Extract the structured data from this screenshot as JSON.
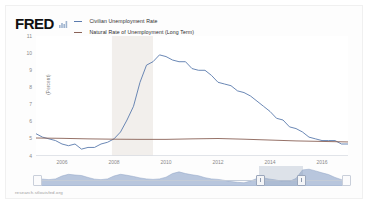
{
  "brand": {
    "logo_text": "FRED",
    "logo_mark": "mini-bar-chart-icon"
  },
  "legend": {
    "items": [
      {
        "label": "Civilian Unemployment Rate",
        "color": "#5a7aad",
        "icon": "line-dash-icon"
      },
      {
        "label": "Natural Rate of Unemployment (Long Term)",
        "color": "#8a6257",
        "icon": "line-dash-icon"
      }
    ]
  },
  "footer": {
    "source": "research.stlouisfed.org"
  },
  "navigator": {
    "selection_label": "",
    "left_handle": "range-handle-left",
    "right_handle": "range-handle-right"
  },
  "chart_data": {
    "type": "line",
    "title": "",
    "xlabel": "",
    "ylabel": "(Percent)",
    "ylim": [
      4,
      11
    ],
    "xlim": [
      2005.0,
      2017.0
    ],
    "grid": false,
    "legend_position": "top-left",
    "yticks": [
      11,
      10,
      9,
      8,
      7,
      6,
      5,
      4
    ],
    "xticks": [
      2006,
      2008,
      2010,
      2012,
      2014,
      2016
    ],
    "shaded_regions": [
      {
        "name": "recession",
        "x0": 2007.92,
        "x1": 2009.5,
        "color": "#f2efec"
      }
    ],
    "series": [
      {
        "name": "Civilian Unemployment Rate",
        "color": "#5a7aad",
        "x": [
          2005.0,
          2005.25,
          2005.5,
          2005.75,
          2006.0,
          2006.25,
          2006.5,
          2006.75,
          2007.0,
          2007.25,
          2007.5,
          2007.75,
          2008.0,
          2008.25,
          2008.5,
          2008.75,
          2009.0,
          2009.25,
          2009.5,
          2009.75,
          2010.0,
          2010.25,
          2010.5,
          2010.75,
          2011.0,
          2011.25,
          2011.5,
          2011.75,
          2012.0,
          2012.25,
          2012.5,
          2012.75,
          2013.0,
          2013.25,
          2013.5,
          2013.75,
          2014.0,
          2014.25,
          2014.5,
          2014.75,
          2015.0,
          2015.25,
          2015.5,
          2015.75,
          2016.0,
          2016.25,
          2016.5,
          2016.75,
          2017.0
        ],
        "y": [
          5.3,
          5.1,
          5.0,
          4.9,
          4.7,
          4.6,
          4.7,
          4.4,
          4.5,
          4.5,
          4.7,
          4.8,
          5.0,
          5.4,
          6.1,
          6.9,
          8.3,
          9.3,
          9.5,
          9.9,
          9.8,
          9.6,
          9.5,
          9.5,
          9.1,
          9.0,
          9.0,
          8.7,
          8.3,
          8.2,
          8.1,
          7.8,
          7.7,
          7.5,
          7.2,
          6.9,
          6.6,
          6.2,
          6.1,
          5.7,
          5.6,
          5.4,
          5.1,
          5.0,
          4.9,
          4.9,
          4.9,
          4.7,
          4.7
        ],
        "peak": {
          "x": 2009.83,
          "y": 10.0
        },
        "trough_prerecession": {
          "x": 2006.75,
          "y": 4.4
        },
        "final": {
          "x": 2017.0,
          "y": 4.7
        }
      },
      {
        "name": "Natural Rate of Unemployment (Long Term)",
        "color": "#8a6257",
        "x": [
          2005.0,
          2006.0,
          2007.0,
          2008.0,
          2009.0,
          2010.0,
          2011.0,
          2012.0,
          2013.0,
          2014.0,
          2015.0,
          2016.0,
          2017.0
        ],
        "y": [
          5.05,
          5.03,
          5.0,
          4.98,
          4.97,
          4.97,
          5.0,
          5.02,
          4.98,
          4.93,
          4.88,
          4.85,
          4.82
        ]
      }
    ]
  }
}
